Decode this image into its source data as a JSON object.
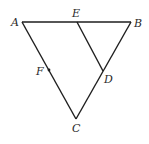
{
  "diagram": {
    "type": "geometry",
    "points": {
      "A": {
        "label": "A",
        "x": 22,
        "y": 22
      },
      "B": {
        "label": "B",
        "x": 131,
        "y": 22
      },
      "C": {
        "label": "C",
        "x": 76,
        "y": 119
      },
      "E": {
        "label": "E",
        "x": 77,
        "y": 22
      },
      "D": {
        "label": "D",
        "x": 103,
        "y": 71
      },
      "F": {
        "label": "F",
        "x": 49,
        "y": 70
      }
    },
    "segments": [
      [
        "A",
        "B"
      ],
      [
        "B",
        "C"
      ],
      [
        "C",
        "A"
      ],
      [
        "E",
        "D"
      ]
    ],
    "line_color": "#1e1e1e"
  }
}
